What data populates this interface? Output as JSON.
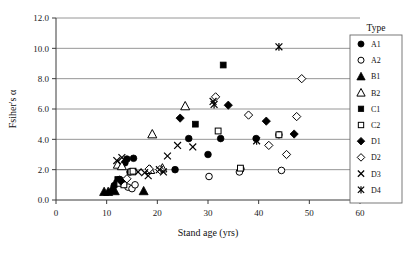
{
  "chart_data": {
    "type": "scatter",
    "title": "",
    "xlabel": "Stand age (yrs)",
    "ylabel": "Fsiher's α",
    "xlim": [
      0,
      60
    ],
    "ylim": [
      0,
      12
    ],
    "xticks": [
      "0",
      "10",
      "20",
      "30",
      "40",
      "50",
      "60"
    ],
    "yticks": [
      "0.0",
      "2.0",
      "4.0",
      "6.0",
      "8.0",
      "10.0",
      "12.0"
    ],
    "grid": "horizontal",
    "legend_position": "top-right-inside",
    "legend_title": "Type",
    "series": [
      {
        "name": "A1",
        "marker": "filled-circle",
        "points": [
          [
            11.5,
            0.95
          ],
          [
            12.0,
            1.15
          ],
          [
            12.6,
            1.35
          ],
          [
            13.6,
            2.45
          ],
          [
            14.0,
            2.7
          ],
          [
            14.6,
            1.85
          ],
          [
            15.3,
            2.75
          ],
          [
            23.5,
            2.0
          ],
          [
            26.2,
            4.05
          ],
          [
            30.0,
            3.0
          ],
          [
            32.5,
            4.05
          ],
          [
            36.5,
            2.05
          ],
          [
            39.5,
            4.05
          ],
          [
            44.0,
            4.3
          ]
        ]
      },
      {
        "name": "A2",
        "marker": "open-circle",
        "points": [
          [
            12.5,
            1.35
          ],
          [
            13.2,
            1.1
          ],
          [
            14.2,
            0.85
          ],
          [
            15.0,
            0.75
          ],
          [
            15.6,
            1.0
          ],
          [
            30.2,
            1.55
          ],
          [
            36.2,
            1.85
          ],
          [
            44.5,
            1.95
          ]
        ]
      },
      {
        "name": "B1",
        "marker": "filled-triangle",
        "points": [
          [
            9.5,
            0.55
          ],
          [
            10.3,
            0.55
          ],
          [
            11.0,
            0.7
          ],
          [
            11.6,
            0.6
          ],
          [
            17.3,
            0.6
          ]
        ]
      },
      {
        "name": "B2",
        "marker": "open-triangle",
        "points": [
          [
            12.2,
            2.35
          ],
          [
            13.0,
            2.25
          ],
          [
            18.6,
            2.0
          ],
          [
            19.0,
            4.35
          ],
          [
            21.0,
            2.1
          ],
          [
            25.5,
            6.2
          ]
        ]
      },
      {
        "name": "C1",
        "marker": "filled-square",
        "points": [
          [
            12.2,
            1.35
          ],
          [
            13.1,
            1.25
          ],
          [
            27.5,
            5.0
          ],
          [
            33.0,
            8.9
          ]
        ]
      },
      {
        "name": "C2",
        "marker": "open-square",
        "points": [
          [
            12.6,
            1.1
          ],
          [
            13.4,
            1.0
          ],
          [
            14.8,
            1.85
          ],
          [
            15.2,
            1.9
          ],
          [
            32.0,
            4.55
          ],
          [
            36.4,
            2.1
          ],
          [
            44.0,
            4.3
          ]
        ]
      },
      {
        "name": "D1",
        "marker": "filled-diamond",
        "points": [
          [
            12.8,
            1.25
          ],
          [
            24.5,
            5.4
          ],
          [
            34.0,
            6.25
          ],
          [
            41.5,
            5.2
          ],
          [
            47.0,
            4.35
          ]
        ]
      },
      {
        "name": "D2",
        "marker": "open-diamond",
        "points": [
          [
            14.0,
            1.4
          ],
          [
            18.4,
            2.05
          ],
          [
            20.5,
            2.0
          ],
          [
            31.5,
            6.8
          ],
          [
            38.0,
            5.6
          ],
          [
            42.0,
            3.6
          ],
          [
            45.5,
            3.0
          ],
          [
            47.5,
            5.5
          ],
          [
            48.5,
            8.0
          ]
        ]
      },
      {
        "name": "D3",
        "marker": "x-cross",
        "points": [
          [
            12.0,
            2.6
          ],
          [
            13.0,
            2.8
          ],
          [
            16.2,
            1.85
          ],
          [
            17.5,
            1.8
          ],
          [
            18.2,
            1.6
          ],
          [
            20.4,
            2.0
          ],
          [
            21.2,
            1.85
          ],
          [
            22.0,
            2.9
          ],
          [
            24.0,
            3.6
          ],
          [
            27.0,
            3.5
          ],
          [
            31.0,
            6.5
          ]
        ]
      },
      {
        "name": "D4",
        "marker": "star-cross",
        "points": [
          [
            31.2,
            6.3
          ],
          [
            39.6,
            3.9
          ],
          [
            44.0,
            10.1
          ]
        ]
      }
    ]
  },
  "legend": {
    "title": "Type",
    "entries": [
      {
        "label": "A1",
        "marker": "filled-circle"
      },
      {
        "label": "A2",
        "marker": "open-circle"
      },
      {
        "label": "B1",
        "marker": "filled-triangle"
      },
      {
        "label": "B2",
        "marker": "open-triangle"
      },
      {
        "label": "C1",
        "marker": "filled-square"
      },
      {
        "label": "C2",
        "marker": "open-square"
      },
      {
        "label": "D1",
        "marker": "filled-diamond"
      },
      {
        "label": "D2",
        "marker": "open-diamond"
      },
      {
        "label": "D3",
        "marker": "x-cross"
      },
      {
        "label": "D4",
        "marker": "star-cross"
      }
    ]
  },
  "colors": {
    "marker": "#000000",
    "grid": "#8a8a8a",
    "axis": "#3a3a3a",
    "background": "#ffffff"
  }
}
